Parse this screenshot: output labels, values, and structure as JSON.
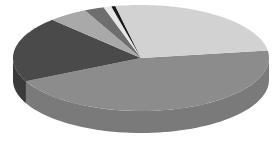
{
  "chart_data": {
    "type": "pie",
    "style": "3d",
    "title": "",
    "legend": null,
    "labels_visible": false,
    "categories": [
      "Slice A",
      "Slice B",
      "Slice C",
      "Slice D",
      "Slice E",
      "Slice F",
      "Slice G"
    ],
    "values": [
      45,
      20,
      5,
      2.5,
      1,
      0.5,
      26
    ],
    "colors": [
      "#8c8c8c",
      "#4a4a4a",
      "#a9a9a9",
      "#6e6e6e",
      "#e6e6e6",
      "#1a1a1a",
      "#d2d2d2"
    ],
    "side_colors": [
      "#7a7a7a",
      "#3a3a3a",
      "#969696",
      "#5e5e5e",
      "#d4d4d4",
      "#111111",
      "#bdbdbd"
    ],
    "start_angle_deg": -8,
    "geometry": {
      "cx": 141,
      "cy": 58,
      "rx": 128,
      "ry": 53,
      "depth": 22
    }
  }
}
